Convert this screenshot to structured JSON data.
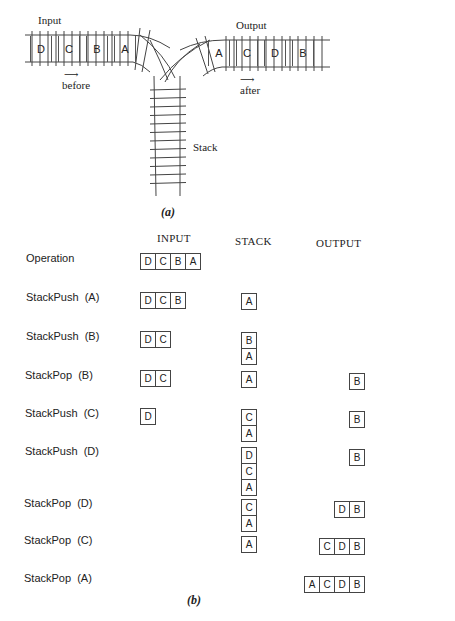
{
  "part_a": {
    "input_label": "Input",
    "output_label": "Output",
    "stack_label": "Stack",
    "before_label": "before",
    "after_label": "after",
    "input_cars": [
      "D",
      "C",
      "B",
      "A"
    ],
    "output_cars": [
      "A",
      "C",
      "D",
      "B"
    ],
    "caption": "(a)"
  },
  "part_b": {
    "headers": {
      "input": "INPUT",
      "stack": "STACK",
      "output": "OUTPUT"
    },
    "caption": "(b)",
    "rows": [
      {
        "operation": "Operation",
        "input": [
          "D",
          "C",
          "B",
          "A"
        ],
        "stack": [],
        "output": []
      },
      {
        "operation": "StackPush  (A)",
        "input": [
          "D",
          "C",
          "B"
        ],
        "stack": [
          "A"
        ],
        "output": []
      },
      {
        "operation": "StackPush  (B)",
        "input": [
          "D",
          "C"
        ],
        "stack": [
          "B",
          "A"
        ],
        "output": []
      },
      {
        "operation": "StackPop  (B)",
        "input": [
          "D",
          "C"
        ],
        "stack": [
          "A"
        ],
        "output": [
          "B"
        ]
      },
      {
        "operation": "StackPush  (C)",
        "input": [
          "D"
        ],
        "stack": [
          "C",
          "A"
        ],
        "output": [
          "B"
        ]
      },
      {
        "operation": "StackPush  (D)",
        "input": [],
        "stack": [
          "D",
          "C",
          "A"
        ],
        "output": [
          "B"
        ]
      },
      {
        "operation": "StackPop  (D)",
        "input": [],
        "stack": [
          "C",
          "A"
        ],
        "output": [
          "D",
          "B"
        ]
      },
      {
        "operation": "StackPop  (C)",
        "input": [],
        "stack": [
          "A"
        ],
        "output": [
          "C",
          "D",
          "B"
        ]
      },
      {
        "operation": "StackPop  (A)",
        "input": [],
        "stack": [],
        "output": [
          "A",
          "C",
          "D",
          "B"
        ]
      }
    ]
  }
}
